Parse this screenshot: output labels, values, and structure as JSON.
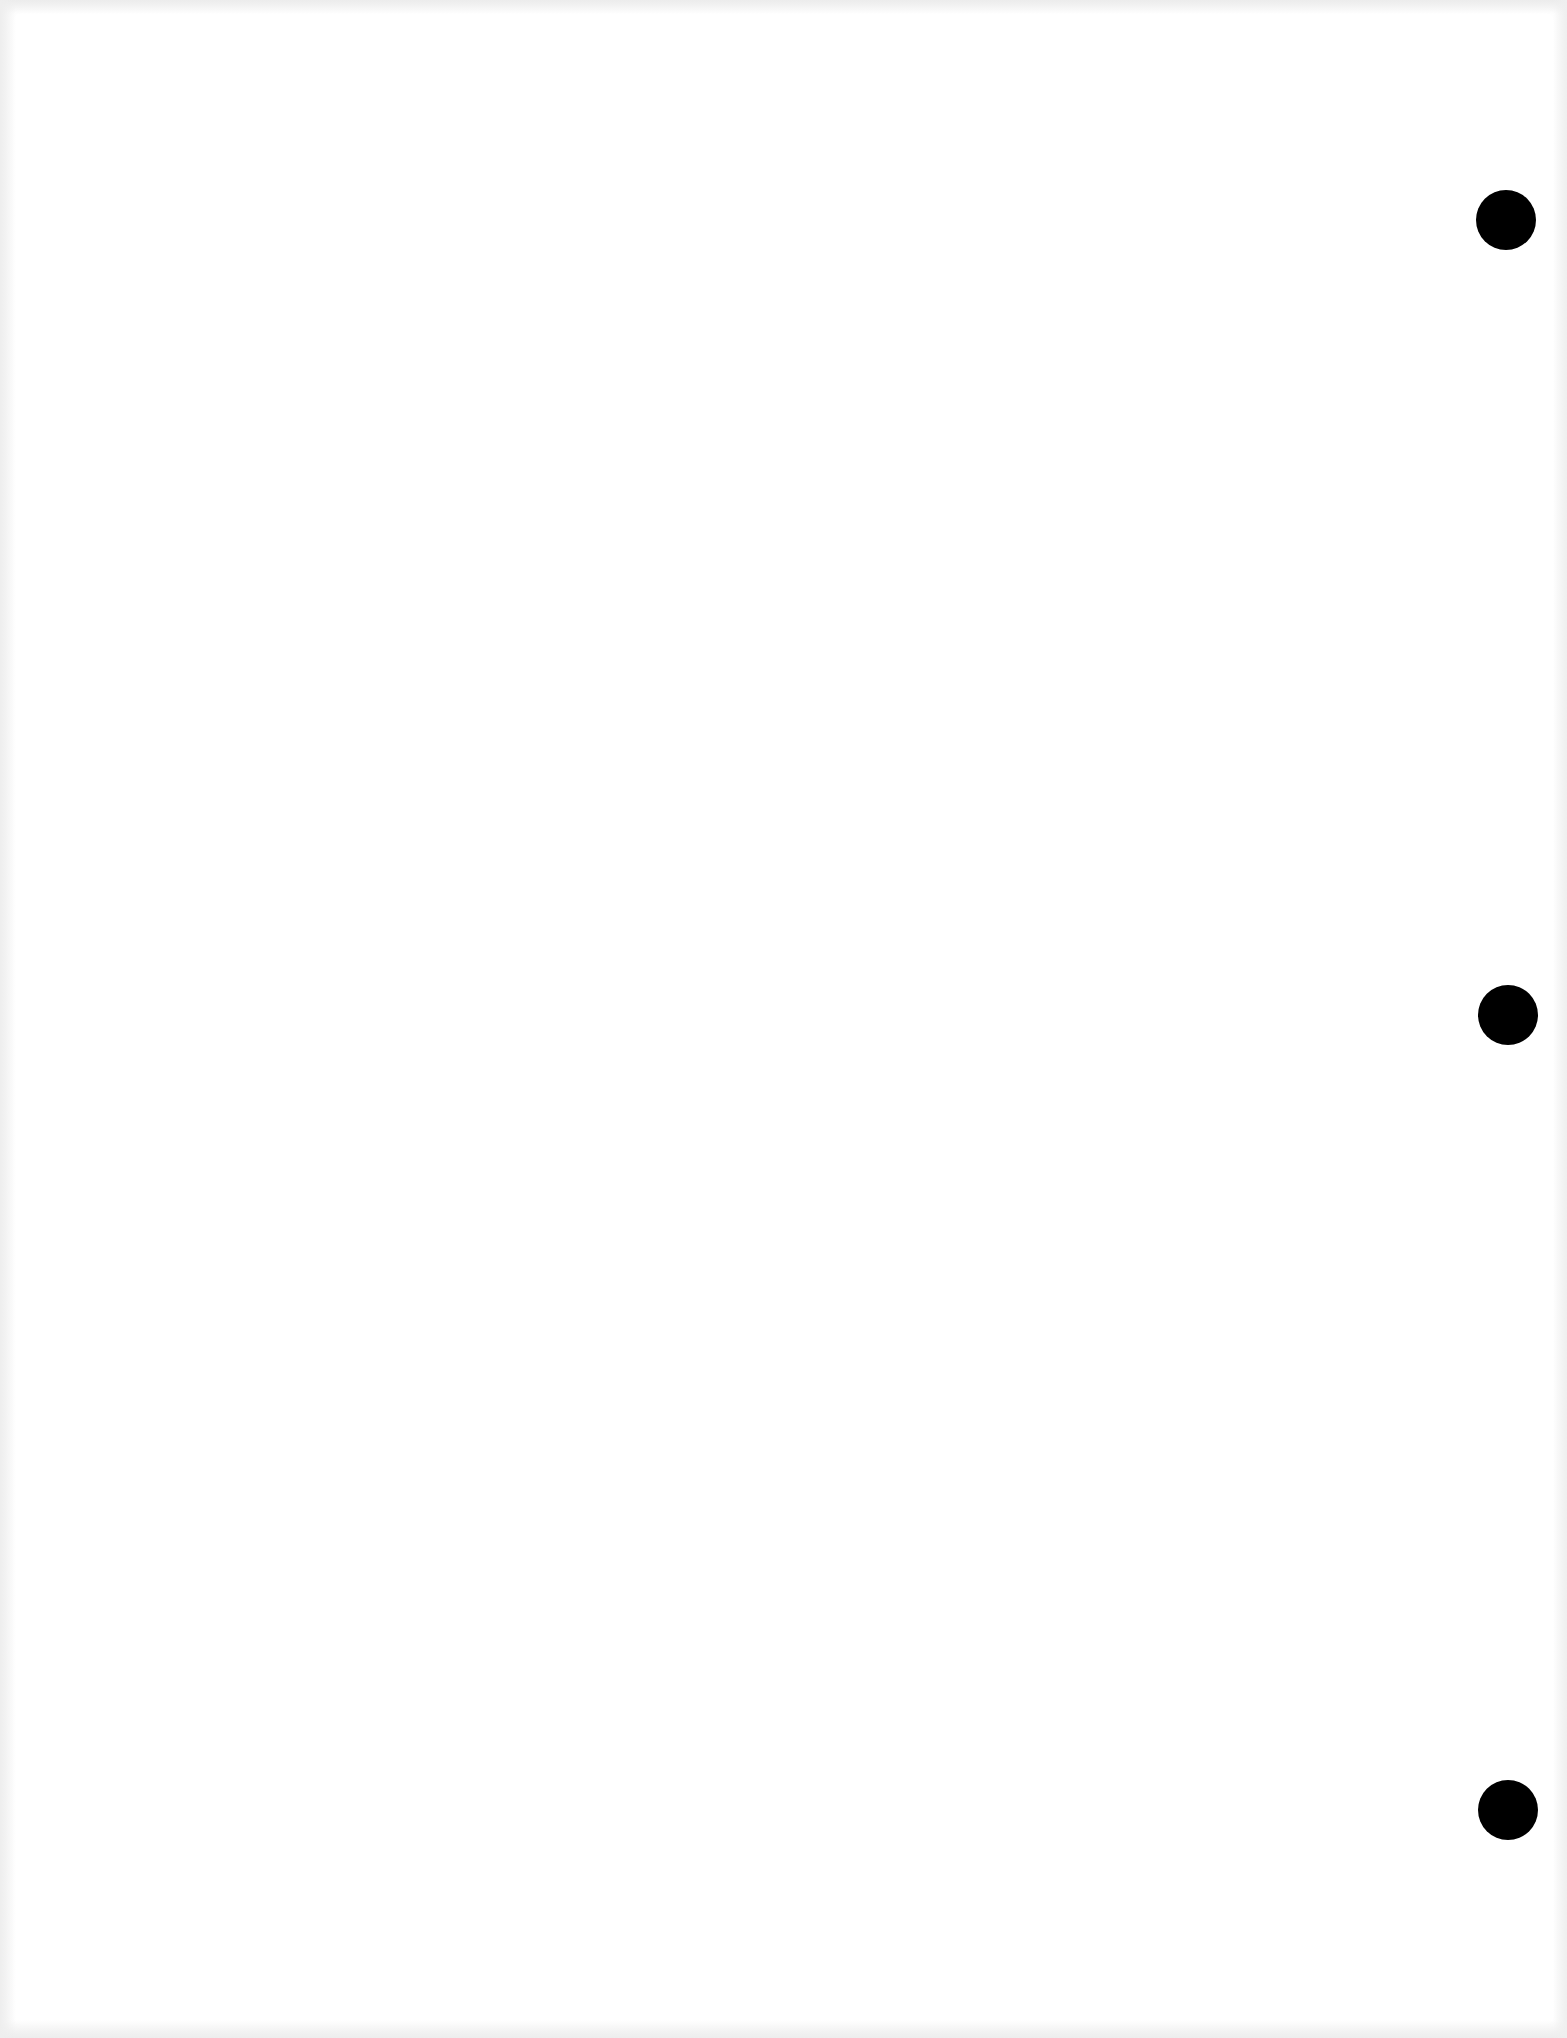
{
  "document": {
    "type": "blank-scanned-page",
    "text": "",
    "page_color": "#ffffff",
    "hole_color": "#000000",
    "punch_holes": [
      {
        "cx": 1506,
        "cy": 220,
        "r": 30
      },
      {
        "cx": 1508,
        "cy": 1015,
        "r": 30
      },
      {
        "cx": 1508,
        "cy": 1810,
        "r": 30
      }
    ]
  }
}
